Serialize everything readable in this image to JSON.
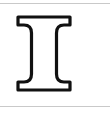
{
  "canvas": {
    "width": 110,
    "height": 113,
    "background_color": "#ffffff"
  },
  "rules": {
    "color": "#c9c9c9",
    "top_y": 3,
    "bottom_y": 106
  },
  "glyph": {
    "character": "I",
    "name": "latin-capital-letter-i",
    "style": "serif-outline",
    "fill_color": "#ffffff",
    "stroke_color": "#111111",
    "stroke_width": 3.2,
    "bounds": {
      "x": 18,
      "y": 16,
      "width": 52,
      "height": 83
    },
    "stem": {
      "left_x": 33,
      "right_x": 56,
      "width": 23
    },
    "serif_top": {
      "left_x": 18,
      "right_x": 70,
      "top_y": 16,
      "bottom_y": 24
    },
    "serif_bottom": {
      "left_x": 18,
      "right_x": 70,
      "top_y": 90,
      "bottom_y": 99
    },
    "outline_path": "M 18 13 L 70 13 L 70 21 L 64 21 C 59 21 56.5 24 56.5 29 L 56.5 70 C 56.5 75 59 78 64 78 L 70 78 L 70 86 L 18 86 L 18 78 L 24 78 C 29 78 31.5 75 31.5 70 L 31.5 29 C 31.5 24 29 21 24 21 L 18 21 Z"
  }
}
